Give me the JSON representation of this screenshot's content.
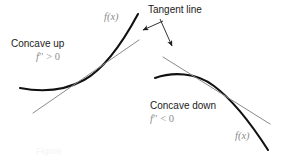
{
  "figure": {
    "caption": "Figure",
    "background_color": "#ffffff",
    "curve_color": "#111111",
    "tangent_color": "#8a8a8a",
    "annotation_color": "#1b1b1b",
    "math_color": "#8c8c8c"
  },
  "labels": {
    "concave_up": "Concave up",
    "fpp_positive": "f'' > 0",
    "concave_down": "Concave down",
    "fpp_negative": "f'' < 0",
    "tangent_line": "Tangent line",
    "fx_left": "f(x)",
    "fx_right": "f(x)"
  },
  "math": {
    "fpp_positive_symbol": "f",
    "fpp_positive_primes": "′′",
    "fpp_positive_relation": " > 0",
    "fpp_negative_symbol": "f",
    "fpp_negative_primes": "′′",
    "fpp_negative_relation": " < 0",
    "fx_symbol": "f",
    "fx_open": "(",
    "fx_var": "x",
    "fx_close": ")"
  },
  "geometry": {
    "left_curve": {
      "name": "concave-up-curve",
      "path": "M 20 88 C 40 92 62 92 84 80 C 106 68 124 40 138 14",
      "description": "Upward concave curve rising to the right"
    },
    "left_tangent": {
      "name": "left-tangent-line",
      "path": "M 33 113 L 139 40",
      "description": "Straight tangent line touching concave-up curve from below"
    },
    "right_curve": {
      "name": "concave-down-curve",
      "path": "M 155 78 C 172 72 196 72 214 86 C 234 101 252 125 268 150",
      "description": "Downward concave curve falling to the right"
    },
    "right_tangent": {
      "name": "right-tangent-line",
      "path": "M 163 57 L 270 124",
      "description": "Straight tangent line touching concave-down curve from above"
    },
    "arrow_left": {
      "name": "tangent-arrow-left",
      "path": "M 163 21 L 141 31",
      "description": "Arrow from Tangent line label to left tangent"
    },
    "arrow_right": {
      "name": "tangent-arrow-right",
      "path": "M 160 19 L 173 48",
      "description": "Arrow from Tangent line label to right tangent"
    }
  }
}
